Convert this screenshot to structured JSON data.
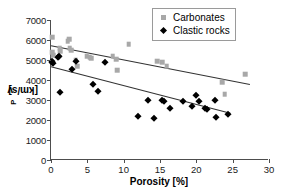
{
  "chart_data": {
    "type": "scatter",
    "title": "",
    "xlabel": "Porosity [%]",
    "ylabel": "v_P [km/s]",
    "ylabel_main": "v",
    "ylabel_sub": "P",
    "ylabel_unit": " [km/s]",
    "xlim": [
      0,
      30
    ],
    "ylim": [
      0,
      7000
    ],
    "xticks": [
      0,
      5,
      10,
      15,
      20,
      25,
      30
    ],
    "yticks": [
      0,
      1000,
      2000,
      3000,
      4000,
      5000,
      6000,
      7000
    ],
    "grid": false,
    "legend_position": "top-right",
    "colors": {
      "carbonates": "#a8a8a8",
      "clastic": "#000000",
      "axis": "#4d4d4d",
      "trendline": "#333333"
    },
    "series": [
      {
        "name": "Carbonates",
        "marker": "square",
        "color": "#a8a8a8",
        "points": [
          [
            0.15,
            6150
          ],
          [
            0.2,
            5400
          ],
          [
            0.3,
            5250
          ],
          [
            1.2,
            5600
          ],
          [
            1.3,
            5450
          ],
          [
            2.3,
            5950
          ],
          [
            2.5,
            6050
          ],
          [
            2.6,
            5600
          ],
          [
            2.8,
            5500
          ],
          [
            3.4,
            5000
          ],
          [
            3.6,
            4700
          ],
          [
            4.9,
            5200
          ],
          [
            5.3,
            5150
          ],
          [
            5.5,
            5100
          ],
          [
            8.5,
            5200
          ],
          [
            9.0,
            5050
          ],
          [
            9.1,
            4500
          ],
          [
            10.7,
            5800
          ],
          [
            14.6,
            4950
          ],
          [
            15.3,
            4900
          ],
          [
            15.9,
            4700
          ],
          [
            23.6,
            3900
          ],
          [
            23.9,
            3300
          ],
          [
            26.7,
            4300
          ]
        ]
      },
      {
        "name": "Clastic rocks",
        "marker": "diamond",
        "color": "#000000",
        "points": [
          [
            0.1,
            4900
          ],
          [
            0.2,
            4950
          ],
          [
            0.3,
            4850
          ],
          [
            1.0,
            5150
          ],
          [
            1.1,
            5200
          ],
          [
            1.2,
            3400
          ],
          [
            2.9,
            4550
          ],
          [
            3.5,
            4950
          ],
          [
            5.8,
            3800
          ],
          [
            6.4,
            3450
          ],
          [
            7.4,
            4900
          ],
          [
            12.0,
            2200
          ],
          [
            13.4,
            3000
          ],
          [
            14.2,
            2100
          ],
          [
            15.3,
            3000
          ],
          [
            15.6,
            2950
          ],
          [
            16.4,
            2600
          ],
          [
            18.2,
            2950
          ],
          [
            19.4,
            2700
          ],
          [
            20.0,
            3250
          ],
          [
            20.4,
            2950
          ],
          [
            21.2,
            2600
          ],
          [
            21.4,
            2550
          ],
          [
            22.6,
            3000
          ],
          [
            22.7,
            2150
          ],
          [
            24.4,
            2300
          ]
        ]
      }
    ],
    "trendlines": [
      {
        "name": "Carbonates trend",
        "series": "Carbonates",
        "x1": 0.0,
        "y1": 5700,
        "x2": 27.5,
        "y2": 3750
      },
      {
        "name": "Clastic rocks trend",
        "series": "Clastic rocks",
        "x1": 0.0,
        "y1": 4650,
        "x2": 24.8,
        "y2": 2300
      }
    ],
    "legend": [
      {
        "label": "Carbonates",
        "marker": "square",
        "color": "#a8a8a8"
      },
      {
        "label": "Clastic rocks",
        "marker": "diamond",
        "color": "#000000"
      }
    ]
  }
}
